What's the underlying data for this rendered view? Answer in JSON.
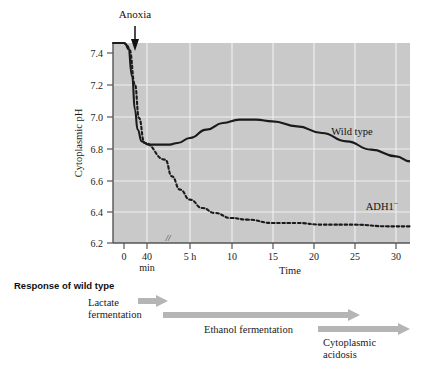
{
  "figure": {
    "annotation_arrow_label": "Anoxia",
    "plot_bg_color": "#c9c9c9",
    "grid_color": "#efefef",
    "axis_color": "#555555",
    "wild_type_color": "#1a1a1a",
    "adh1_color": "#1a1a1a",
    "caption_arrow_color": "#b5b5b5"
  },
  "chart_data": {
    "type": "line",
    "title": "",
    "xlabel": "Time",
    "ylabel": "Cytoplasmic pH",
    "ylim": [
      6.2,
      7.4
    ],
    "yticks": [
      6.2,
      6.4,
      6.6,
      6.8,
      7.0,
      7.2,
      7.4
    ],
    "ytick_labels": [
      "6.2",
      "6.4",
      "6.6",
      "6.8",
      "7.0",
      "7.2",
      "7.4"
    ],
    "xtick_labels": [
      "0",
      "40",
      "5 h",
      "10",
      "15",
      "20",
      "25",
      "30"
    ],
    "xtick_sublabel": "min",
    "axis_break_marker": "//",
    "grid": true,
    "legend_position": "inline-annotations",
    "annotations": [
      {
        "text": "Anoxia",
        "x": "0",
        "note": "arrow marking onset of anoxia at time 0"
      },
      {
        "text": "Wild type",
        "x": "27 h",
        "y": "6.95"
      },
      {
        "text": "ADH1⁻",
        "x": "27 h",
        "y": "6.42"
      }
    ],
    "series": [
      {
        "name": "Wild type",
        "style": "solid",
        "points": [
          {
            "t": -5,
            "pH": 7.4
          },
          {
            "t": -2,
            "pH": 7.4
          },
          {
            "t": 0,
            "pH": 7.4
          },
          {
            "t": 0.3,
            "pH": 7.38
          },
          {
            "t": 0.6,
            "pH": 7.2
          },
          {
            "t": 0.8,
            "pH": 7.0
          },
          {
            "t": 1.0,
            "pH": 6.88
          },
          {
            "t": 1.3,
            "pH": 6.81
          },
          {
            "t": 1.8,
            "pH": 6.79
          },
          {
            "t": 2.5,
            "pH": 6.79
          },
          {
            "t": 3.5,
            "pH": 6.8
          },
          {
            "t": 5.0,
            "pH": 6.83
          },
          {
            "t": 7.0,
            "pH": 6.88
          },
          {
            "t": 9.0,
            "pH": 6.92
          },
          {
            "t": 11.0,
            "pH": 6.94
          },
          {
            "t": 13.0,
            "pH": 6.94
          },
          {
            "t": 15.0,
            "pH": 6.93
          },
          {
            "t": 18.0,
            "pH": 6.9
          },
          {
            "t": 21.0,
            "pH": 6.86
          },
          {
            "t": 24.0,
            "pH": 6.81
          },
          {
            "t": 27.0,
            "pH": 6.76
          },
          {
            "t": 30.0,
            "pH": 6.72
          },
          {
            "t": 33.0,
            "pH": 6.69
          }
        ]
      },
      {
        "name": "ADH1⁻",
        "style": "dotted",
        "points": [
          {
            "t": -5,
            "pH": 7.4
          },
          {
            "t": -2,
            "pH": 7.4
          },
          {
            "t": 0,
            "pH": 7.4
          },
          {
            "t": 0.4,
            "pH": 7.36
          },
          {
            "t": 0.8,
            "pH": 7.15
          },
          {
            "t": 1.1,
            "pH": 6.95
          },
          {
            "t": 1.5,
            "pH": 6.8
          },
          {
            "t": 2.0,
            "pH": 6.7
          },
          {
            "t": 2.8,
            "pH": 6.6
          },
          {
            "t": 3.8,
            "pH": 6.52
          },
          {
            "t": 5.0,
            "pH": 6.46
          },
          {
            "t": 6.5,
            "pH": 6.41
          },
          {
            "t": 8.0,
            "pH": 6.38
          },
          {
            "t": 10.0,
            "pH": 6.35
          },
          {
            "t": 12.0,
            "pH": 6.34
          },
          {
            "t": 15.0,
            "pH": 6.32
          },
          {
            "t": 18.0,
            "pH": 6.32
          },
          {
            "t": 21.0,
            "pH": 6.31
          },
          {
            "t": 25.0,
            "pH": 6.31
          },
          {
            "t": 29.0,
            "pH": 6.3
          },
          {
            "t": 33.0,
            "pH": 6.3
          }
        ]
      }
    ]
  },
  "caption": {
    "heading": "Response of wild type",
    "phases": [
      {
        "label_line1": "Lactate",
        "label_line2": "fermentation"
      },
      {
        "label_line1": "Ethanol fermentation",
        "label_line2": ""
      },
      {
        "label_line1": "Cytoplasmic",
        "label_line2": "acidosis"
      }
    ]
  }
}
